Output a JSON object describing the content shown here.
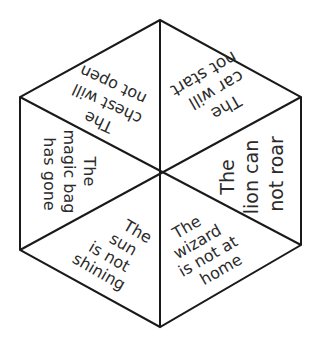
{
  "diagram": {
    "type": "hexagon-spinner",
    "colors": {
      "background": "#ffffff",
      "line": "#1a1a1a",
      "text": "#2b2b2b"
    },
    "segments": [
      {
        "position": "top-right",
        "lines": [
          "The",
          "car will",
          "not start"
        ],
        "rotation_deg": 150
      },
      {
        "position": "right",
        "lines": [
          "The",
          "lion can",
          "not roar"
        ],
        "rotation_deg": -90
      },
      {
        "position": "bottom-right",
        "lines": [
          "The",
          "wizard",
          "is not at",
          "home"
        ],
        "rotation_deg": -30
      },
      {
        "position": "bottom-left",
        "lines": [
          "The",
          "sun",
          "is not",
          "shining"
        ],
        "rotation_deg": 30
      },
      {
        "position": "left",
        "lines": [
          "The",
          "magic bag",
          "has gone"
        ],
        "rotation_deg": 90
      },
      {
        "position": "top-left",
        "lines": [
          "The",
          "chest will",
          "not open"
        ],
        "rotation_deg": 210
      }
    ]
  }
}
